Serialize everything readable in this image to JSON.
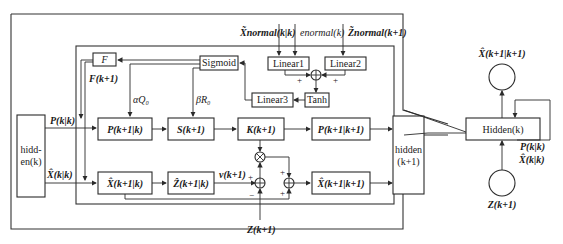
{
  "inputs": {
    "x_normal": "X̃normal(k|k)",
    "e_normal": "enormal(k)",
    "z_normal": "Z̃normal(k+1)"
  },
  "blocks": {
    "F": "F",
    "sigmoid": "Sigmoid",
    "linear1": "Linear1",
    "linear2": "Linear2",
    "linear3": "Linear3",
    "tanh": "Tanh",
    "hidden_k": "hidd-\nen(k)",
    "hidden_k_line1": "hidd-",
    "hidden_k_line2": "en(k)",
    "hidden_k1_line1": "hidden",
    "hidden_k1_line2": "(k+1)",
    "P_pred": "P(k+1|k)",
    "S": "S(k+1)",
    "K": "K(k+1)",
    "P_upd": "P(k+1|k+1)",
    "X_pred": "X̂(k+1|k)",
    "Z_pred": "Ẑ(k+1|k)",
    "X_upd": "X̂(k+1|k+1)",
    "Hidden": "Hidden(k)"
  },
  "labels": {
    "F_k1": "F(k+1)",
    "alphaQ": "αQ₀",
    "betaR": "βR₀",
    "P_kk": "P(k|k)",
    "X_kk": "X̂(k|k)",
    "v": "v(k+1)",
    "Z_k1": "Z(k+1)",
    "plus": "+",
    "minus": "−",
    "right_X_out": "X̂(k+1|k+1)",
    "right_P_kk": "P(k|k)",
    "right_X_kk": "X̂(k|k)",
    "right_Z": "Z(k+1)"
  }
}
